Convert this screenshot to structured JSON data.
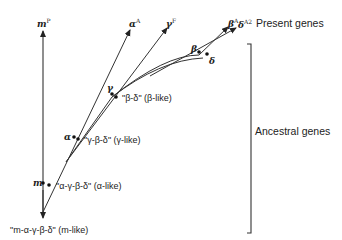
{
  "diagram": {
    "group_labels": {
      "present": "Present genes",
      "ancestral": "Ancestral genes"
    },
    "present_genes": [
      {
        "base": "m",
        "sup": "P"
      },
      {
        "base": "α",
        "sup": "A"
      },
      {
        "base": "γ",
        "sup": "F"
      },
      {
        "base": "β",
        "sup": "A"
      },
      {
        "base": "δ",
        "sup": "A2"
      }
    ],
    "branch_points": [
      {
        "name": "m",
        "label": "m",
        "ancestor": "\"α-γ-β-δ\" (α-like)"
      },
      {
        "name": "alpha",
        "label": "α",
        "ancestor": "\"γ-β-δ\" (γ-like)"
      },
      {
        "name": "gamma",
        "label": "γ",
        "ancestor": "\"β-δ\" (β-like)"
      },
      {
        "name": "beta",
        "label": "β"
      },
      {
        "name": "delta",
        "label": "δ"
      }
    ],
    "root_ancestor": "\"m-α-γ-β-δ\" (m-like)",
    "line_color": "#333333"
  }
}
